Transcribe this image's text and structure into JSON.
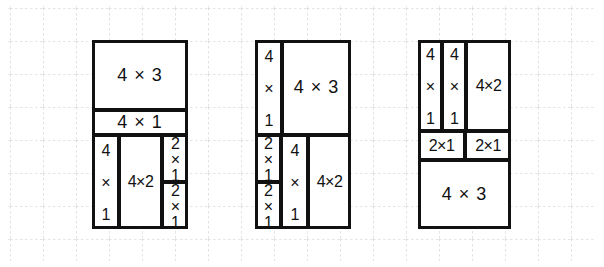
{
  "diagram": {
    "background": "graph-paper",
    "grid_color": "#c9c9d2",
    "line_color": "#111111",
    "figures": [
      {
        "name": "figure-1",
        "x": 92,
        "y": 40,
        "w": 96,
        "h": 189,
        "blocks": [
          {
            "label": "4 × 3",
            "x": 0,
            "y": 0,
            "w": 96,
            "h": 70,
            "orient": "h",
            "size": "wide"
          },
          {
            "label": "4 × 1",
            "x": 0,
            "y": 70,
            "w": 96,
            "h": 25,
            "orient": "h",
            "size": "wide"
          },
          {
            "label": "4 × 1",
            "x": 0,
            "y": 95,
            "w": 27,
            "h": 94,
            "orient": "v",
            "size": "rot"
          },
          {
            "label": "4×2",
            "x": 27,
            "y": 95,
            "w": 43,
            "h": 94,
            "orient": "h",
            "size": "tight"
          },
          {
            "label": "2×1",
            "x": 70,
            "y": 95,
            "w": 26,
            "h": 47,
            "orient": "v",
            "size": "rot"
          },
          {
            "label": "2×1",
            "x": 70,
            "y": 142,
            "w": 26,
            "h": 47,
            "orient": "v",
            "size": "rot"
          }
        ]
      },
      {
        "name": "figure-2",
        "x": 255,
        "y": 40,
        "w": 96,
        "h": 189,
        "blocks": [
          {
            "label": "4 × 1",
            "x": 0,
            "y": 0,
            "w": 27,
            "h": 95,
            "orient": "v",
            "size": "rot"
          },
          {
            "label": "4 × 3",
            "x": 27,
            "y": 0,
            "w": 69,
            "h": 95,
            "orient": "h",
            "size": "wide"
          },
          {
            "label": "2×1",
            "x": 0,
            "y": 95,
            "w": 26,
            "h": 47,
            "orient": "v",
            "size": "rot"
          },
          {
            "label": "2×1",
            "x": 0,
            "y": 142,
            "w": 26,
            "h": 47,
            "orient": "v",
            "size": "rot"
          },
          {
            "label": "4 × 1",
            "x": 26,
            "y": 95,
            "w": 27,
            "h": 94,
            "orient": "v",
            "size": "rot"
          },
          {
            "label": "4×2",
            "x": 53,
            "y": 95,
            "w": 43,
            "h": 94,
            "orient": "h",
            "size": "tight"
          }
        ]
      },
      {
        "name": "figure-3",
        "x": 418,
        "y": 40,
        "w": 93,
        "h": 189,
        "blocks": [
          {
            "label": "4 × 1",
            "x": 0,
            "y": 0,
            "w": 24,
            "h": 91,
            "orient": "v",
            "size": "rot"
          },
          {
            "label": "4 × 1",
            "x": 24,
            "y": 0,
            "w": 24,
            "h": 91,
            "orient": "v",
            "size": "rot"
          },
          {
            "label": "4×2",
            "x": 48,
            "y": 0,
            "w": 45,
            "h": 91,
            "orient": "h",
            "size": "tight"
          },
          {
            "label": "2×1",
            "x": 0,
            "y": 91,
            "w": 47,
            "h": 29,
            "orient": "h",
            "size": "tight"
          },
          {
            "label": "2×1",
            "x": 47,
            "y": 91,
            "w": 46,
            "h": 29,
            "orient": "h",
            "size": "tight"
          },
          {
            "label": "4 × 3",
            "x": 0,
            "y": 120,
            "w": 93,
            "h": 69,
            "orient": "h",
            "size": "wide"
          }
        ]
      }
    ]
  }
}
